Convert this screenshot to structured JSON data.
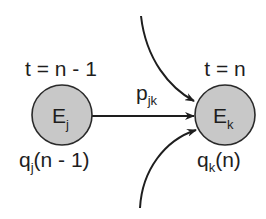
{
  "diagram": {
    "colors": {
      "node_fill": "#c8c8c8",
      "node_stroke": "#2a2a2a",
      "edge": "#1e1e1e",
      "text": "#1e1e1e",
      "background": "#ffffff"
    },
    "nodes": [
      {
        "id": "Ej",
        "label_main": "E",
        "label_sub": "j",
        "time_label": "t = n - 1",
        "queue_label_main": "q",
        "queue_label_sub": "j",
        "queue_label_rest": "(n - 1)"
      },
      {
        "id": "Ek",
        "label_main": "E",
        "label_sub": "k",
        "time_label": "t = n",
        "queue_label_main": "q",
        "queue_label_sub": "k",
        "queue_label_rest": "(n)"
      }
    ],
    "edges": [
      {
        "from": "Ej",
        "to": "Ek",
        "label_main": "p",
        "label_sub": "jk",
        "style": "straight"
      },
      {
        "from": "above",
        "to": "Ek",
        "style": "curved-incoming"
      },
      {
        "from": "below",
        "to": "Ek",
        "style": "curved-incoming"
      }
    ]
  }
}
